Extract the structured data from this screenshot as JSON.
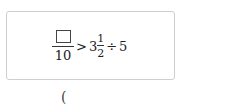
{
  "problem": {
    "blank_numerator": "",
    "denominator": "10",
    "comparison": ">",
    "mixed_whole": "3",
    "mixed_num": "1",
    "mixed_den": "2",
    "operator": "÷",
    "divisor": "5"
  },
  "answer": {
    "open_paren": "("
  }
}
